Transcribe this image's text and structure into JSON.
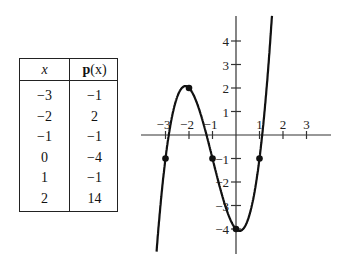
{
  "table": {
    "headers": {
      "x": "x",
      "p_bold": "p",
      "p_rest": "(x)"
    },
    "rows": [
      {
        "x": "−3",
        "p": "−1"
      },
      {
        "x": "−2",
        "p": "2"
      },
      {
        "x": "−1",
        "p": "−1"
      },
      {
        "x": "0",
        "p": "−4"
      },
      {
        "x": "1",
        "p": "−1"
      },
      {
        "x": "2",
        "p": "14"
      }
    ]
  },
  "chart_data": {
    "type": "line",
    "title": "",
    "xlabel": "",
    "ylabel": "",
    "function": "p(x) = x^3 + 3x^2 - x - 4",
    "x_ticks": [
      "−3",
      "−2",
      "−1",
      "1",
      "2",
      "3"
    ],
    "y_ticks": [
      "4",
      "3",
      "2",
      "1",
      "−1",
      "−2",
      "−3",
      "−4"
    ],
    "xlim": [
      -3.5,
      3.5
    ],
    "ylim": [
      -5,
      5
    ],
    "grid": false,
    "marked_points": [
      {
        "x": -3,
        "y": -1
      },
      {
        "x": -2,
        "y": 2
      },
      {
        "x": -1,
        "y": -1
      },
      {
        "x": 0,
        "y": -4
      },
      {
        "x": 1,
        "y": -1
      }
    ],
    "table_points": [
      {
        "x": -3,
        "y": -1
      },
      {
        "x": -2,
        "y": 2
      },
      {
        "x": -1,
        "y": -1
      },
      {
        "x": 0,
        "y": -4
      },
      {
        "x": 1,
        "y": -1
      },
      {
        "x": 2,
        "y": 14
      }
    ]
  }
}
